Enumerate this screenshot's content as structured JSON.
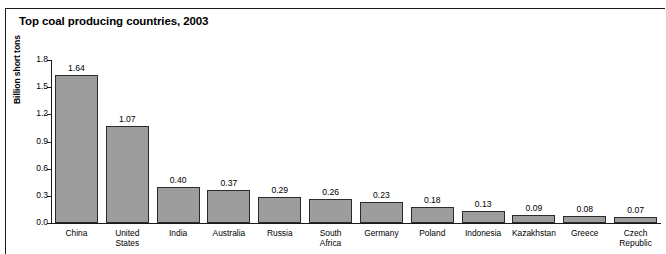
{
  "figure": {
    "title": "Top coal producing countries, 2003",
    "border_color": "#1a1a1a",
    "background": "#ffffff"
  },
  "chart_data": {
    "type": "bar",
    "title": "Top coal producing countries, 2003",
    "xlabel": "",
    "ylabel": "Billion short tons",
    "ylim": [
      0.0,
      1.8
    ],
    "yticks": [
      "0.0",
      "0.3",
      "0.6",
      "0.9",
      "1.2",
      "1.5",
      "1.8"
    ],
    "ytick_values": [
      0.0,
      0.3,
      0.6,
      0.9,
      1.2,
      1.5,
      1.8
    ],
    "grid": false,
    "legend": "none",
    "bar_color": "#9d9d9d",
    "bar_edge_color": "#2b2b2b",
    "categories": [
      "China",
      "United\nStates",
      "India",
      "Australia",
      "Russia",
      "South\nAfrica",
      "Germany",
      "Poland",
      "Indonesia",
      "Kazakhstan",
      "Greece",
      "Czech\nRepublic"
    ],
    "values": [
      1.64,
      1.07,
      0.4,
      0.37,
      0.29,
      0.26,
      0.23,
      0.18,
      0.13,
      0.09,
      0.08,
      0.07
    ],
    "value_labels": [
      "1.64",
      "1.07",
      "0.40",
      "0.37",
      "0.29",
      "0.26",
      "0.23",
      "0.18",
      "0.13",
      "0.09",
      "0.08",
      "0.07"
    ]
  }
}
